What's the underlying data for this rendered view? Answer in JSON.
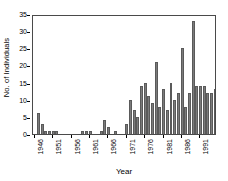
{
  "chart_data": {
    "type": "bar",
    "title": "",
    "xlabel": "Year",
    "ylabel": "No. of Individuals",
    "ylim": [
      0,
      35
    ],
    "yticks": [
      0,
      5,
      10,
      15,
      20,
      25,
      30,
      35
    ],
    "xticks": [
      1946,
      1951,
      1956,
      1961,
      1966,
      1971,
      1976,
      1981,
      1986,
      1991
    ],
    "grid": false,
    "legend": null,
    "bar_color": "#7b7b7b",
    "bar_edge_color": "#5a5a5a",
    "axis_color": "#4a4a4a",
    "categories": [
      1946,
      1947,
      1948,
      1949,
      1950,
      1951,
      1952,
      1953,
      1954,
      1955,
      1956,
      1957,
      1958,
      1959,
      1960,
      1961,
      1962,
      1963,
      1964,
      1965,
      1966,
      1967,
      1968,
      1969,
      1970,
      1971,
      1972,
      1973,
      1974,
      1975,
      1976,
      1977,
      1978,
      1979,
      1980,
      1981,
      1982,
      1983,
      1984,
      1985,
      1986,
      1987,
      1988,
      1989,
      1990,
      1991,
      1992,
      1993,
      1994,
      1995
    ],
    "values": [
      0,
      6,
      3,
      1,
      1,
      1,
      1,
      0,
      0,
      0,
      0,
      0,
      0,
      1,
      1,
      1,
      0,
      0,
      1,
      4,
      2,
      0,
      1,
      0,
      0,
      3,
      10,
      7,
      5,
      14,
      15,
      11,
      9,
      21,
      8,
      13,
      7,
      15,
      10,
      12,
      25,
      8,
      12,
      33,
      14,
      14,
      14,
      12,
      12,
      13
    ]
  },
  "axes": {
    "y_title": "No. of Individuals",
    "x_title": "Year"
  }
}
